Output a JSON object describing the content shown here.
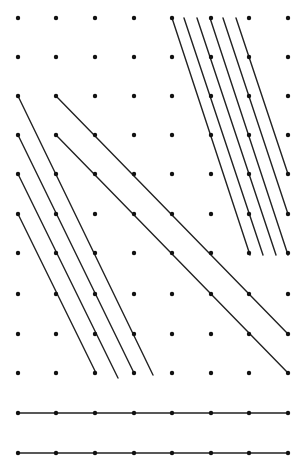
{
  "diagram": {
    "type": "dot-grid-line-segments",
    "colors": {
      "background": "#ffffff",
      "dot": "#111111",
      "line": "#222222"
    },
    "dot_radius": 2.2,
    "line_width": 1.4,
    "grid": {
      "columns_x": [
        18,
        56,
        95,
        134,
        172,
        211,
        249,
        288
      ],
      "rows_y": [
        18,
        57,
        96,
        135,
        174,
        214,
        253,
        294,
        334,
        373,
        413,
        453
      ]
    },
    "segment_groups": [
      {
        "name": "top-right-steep-parallel-lines",
        "segments": [
          [
            172,
            18,
            250,
            255
          ],
          [
            184,
            18,
            263,
            255
          ],
          [
            197,
            18,
            276,
            255
          ],
          [
            210,
            18,
            288,
            255
          ],
          [
            223,
            18,
            288,
            214
          ],
          [
            236,
            18,
            288,
            174
          ]
        ]
      },
      {
        "name": "left-steep-parallel-lines",
        "segments": [
          [
            18,
            96,
            153,
            375
          ],
          [
            18,
            135,
            134,
            373
          ],
          [
            18,
            174,
            118,
            378
          ],
          [
            18,
            214,
            96,
            373
          ]
        ]
      },
      {
        "name": "long-diagonal-lines",
        "segments": [
          [
            56,
            96,
            288,
            334
          ],
          [
            56,
            135,
            288,
            373
          ]
        ]
      },
      {
        "name": "bottom-horizontal-lines",
        "segments": [
          [
            18,
            413,
            288,
            413
          ],
          [
            18,
            453,
            288,
            453
          ]
        ]
      }
    ]
  }
}
